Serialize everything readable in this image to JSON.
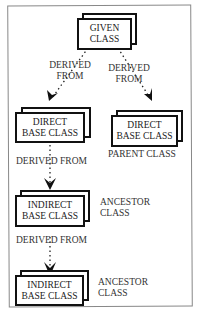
{
  "diagram": {
    "nodes": {
      "given": {
        "line1": "GIVEN",
        "line2": "CLASS"
      },
      "direct_left": {
        "line1": "DIRECT",
        "line2": "BASE CLASS"
      },
      "direct_right": {
        "line1": "DIRECT",
        "line2": "BASE CLASS",
        "caption": "PARENT CLASS"
      },
      "indirect_1": {
        "line1": "INDIRECT",
        "line2": "BASE CLASS",
        "caption1": "ANCESTOR",
        "caption2": "CLASS"
      },
      "indirect_2": {
        "line1": "INDIRECT",
        "line2": "BASE CLASS",
        "caption1": "ANCESTOR",
        "caption2": "CLASS"
      }
    },
    "edges": {
      "left": {
        "line1": "DERIVED",
        "line2": "FROM"
      },
      "right": {
        "line1": "DERIVED",
        "line2": "FROM"
      },
      "mid1": {
        "label": "DERIVED FROM"
      },
      "mid2": {
        "label": "DERIVED FROM"
      }
    }
  }
}
